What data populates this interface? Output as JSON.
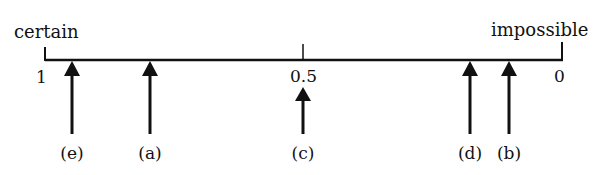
{
  "diagram": {
    "type": "probability-scale",
    "left_label": "certain",
    "right_label": "impossible",
    "ticks": [
      {
        "value": "1",
        "x": 45
      },
      {
        "value": "0.5",
        "x": 303
      },
      {
        "value": "0",
        "x": 562
      }
    ],
    "arrows": [
      {
        "label": "(e)",
        "x": 72
      },
      {
        "label": "(a)",
        "x": 150
      },
      {
        "label": "(c)",
        "x": 303
      },
      {
        "label": "(d)",
        "x": 470
      },
      {
        "label": "(b)",
        "x": 509
      }
    ],
    "colors": {
      "ink": "#111111",
      "background": "#ffffff"
    }
  }
}
